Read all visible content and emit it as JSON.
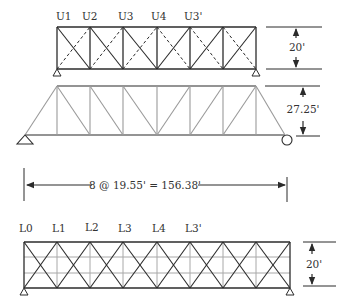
{
  "figure": {
    "colors": {
      "member_dark": "#2b2b2b",
      "member_gray": "#9a9a9a",
      "text": "#333333",
      "background": "#ffffff"
    },
    "top_bracing_plan": {
      "node_labels": [
        "U1",
        "U2",
        "U3",
        "U4",
        "U3'"
      ],
      "height_dimension": "20'",
      "panels": 6,
      "diagonal_styles": [
        "solid",
        "dashed"
      ]
    },
    "elevation": {
      "height_dimension": "27.25'",
      "left_support": "pin",
      "right_support": "roller"
    },
    "span_dimension": {
      "text": "8 @ 19.55' = 156.38'",
      "panels": 8,
      "panel_length": "19.55'",
      "total_length": "156.38'"
    },
    "bottom_bracing_plan": {
      "node_labels": [
        "L0",
        "L1",
        "L2",
        "L3",
        "L4",
        "L3'"
      ],
      "height_dimension": "20'",
      "panels": 8
    }
  }
}
